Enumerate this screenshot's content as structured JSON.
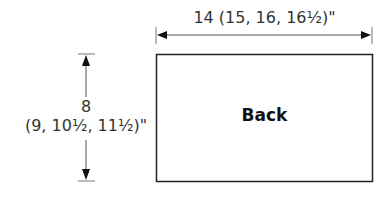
{
  "diagram": {
    "panel": {
      "label": "Back"
    },
    "width_dimension": {
      "label": "14 (15, 16, 16½)\""
    },
    "height_dimension": {
      "value": "8",
      "alternates": "(9, 10½, 11½)\""
    },
    "colors": {
      "line": "#222222",
      "dimension_line": "#555555",
      "text": "#333333"
    }
  }
}
